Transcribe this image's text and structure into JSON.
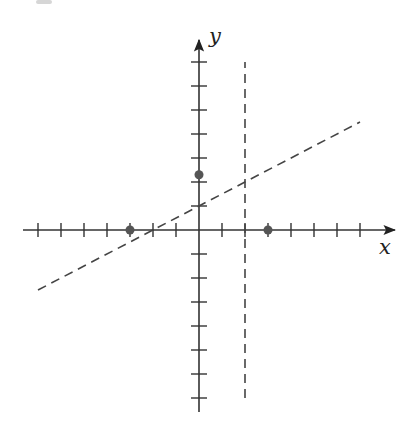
{
  "chart_data": {
    "type": "line",
    "title": "",
    "xlabel": "x",
    "ylabel": "y",
    "xlim": [
      -7.5,
      8.5
    ],
    "ylim": [
      -7.5,
      7.8
    ],
    "grid": false,
    "tick_labels": "none (unlabeled unit ticks)",
    "x_ticks": [
      -7,
      -6,
      -5,
      -4,
      -3,
      -2,
      -1,
      1,
      2,
      3,
      4,
      5,
      6,
      7
    ],
    "y_ticks": [
      -7,
      -6,
      -5,
      -4,
      -3,
      -2,
      -1,
      1,
      2,
      3,
      4,
      5,
      6,
      7
    ],
    "series": [
      {
        "name": "oblique asymptote",
        "style": "dashed",
        "equation": "y = 0.5x + 1",
        "x": [
          -7,
          7
        ],
        "y": [
          -2.5,
          4.5
        ]
      },
      {
        "name": "vertical asymptote",
        "style": "dashed",
        "equation": "x = 2",
        "x": [
          2,
          2
        ],
        "y": [
          -7,
          7
        ]
      }
    ],
    "points": [
      {
        "name": "x-intercept left",
        "x": -3,
        "y": 0
      },
      {
        "name": "x-intercept right",
        "x": 3,
        "y": 0
      },
      {
        "name": "y-intercept",
        "x": 0,
        "y": 2.3
      }
    ],
    "colors": {
      "axis": "#333333",
      "dashed": "#444444",
      "point": "#555555"
    }
  },
  "layout": {
    "origin_px": [
      199,
      230
    ],
    "unit_x_px": 23,
    "unit_y_px": 24
  }
}
